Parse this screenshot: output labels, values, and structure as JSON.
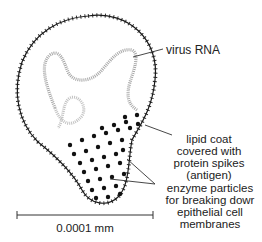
{
  "diagram": {
    "labels": {
      "virus_rna": "virus RNA",
      "lipid_coat": [
        "lipid coat",
        "covered with",
        "protein spikes",
        "(antigen)"
      ],
      "enzyme": [
        "enzyme particles",
        "for breaking dowr",
        "epithelial cell",
        "membranes"
      ]
    },
    "scale_bar": {
      "label": "0.0001 mm"
    },
    "colors": {
      "ink": "#1a1a1a",
      "rna": "#9a9a9a",
      "background": "#ffffff"
    }
  }
}
